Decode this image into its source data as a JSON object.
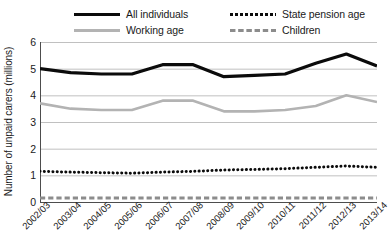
{
  "chart_data": {
    "type": "line",
    "title": "",
    "xlabel": "",
    "ylabel": "Number of unpaid carers (millions)",
    "ylim": [
      0,
      6
    ],
    "yticks": [
      0,
      1,
      2,
      3,
      4,
      5,
      6
    ],
    "grid": true,
    "legend_position": "top",
    "categories": [
      "2002/03",
      "2003/04",
      "2004/05",
      "2005/06",
      "2006/07",
      "2007/08",
      "2008/09",
      "2009/10",
      "2010/11",
      "2011/12",
      "2012/13",
      "2013/14"
    ],
    "series": [
      {
        "name": "All individuals",
        "style": "solid",
        "color": "#0b0b0b",
        "values": [
          5.0,
          4.85,
          4.8,
          4.8,
          5.15,
          5.15,
          4.7,
          4.75,
          4.8,
          5.2,
          5.55,
          5.1
        ]
      },
      {
        "name": "Working age",
        "style": "solid",
        "color": "#b3b3b3",
        "values": [
          3.7,
          3.5,
          3.45,
          3.45,
          3.8,
          3.8,
          3.4,
          3.4,
          3.45,
          3.6,
          4.0,
          3.75
        ]
      },
      {
        "name": "State pension age",
        "style": "dotted",
        "color": "#0b0b0b",
        "values": [
          1.15,
          1.12,
          1.1,
          1.08,
          1.12,
          1.15,
          1.2,
          1.22,
          1.25,
          1.3,
          1.35,
          1.3
        ]
      },
      {
        "name": "Children",
        "style": "dashed",
        "color": "#8c8c8c",
        "values": [
          0.15,
          0.15,
          0.15,
          0.15,
          0.15,
          0.15,
          0.15,
          0.15,
          0.15,
          0.15,
          0.15,
          0.15
        ]
      }
    ]
  },
  "legend": {
    "items": [
      {
        "label": "All individuals"
      },
      {
        "label": "Working age"
      },
      {
        "label": "State pension age"
      },
      {
        "label": "Children"
      }
    ]
  },
  "axes": {
    "y_title": "Number of unpaid carers (millions)",
    "y_ticks": [
      "6",
      "5",
      "4",
      "3",
      "2",
      "1",
      "0"
    ]
  }
}
